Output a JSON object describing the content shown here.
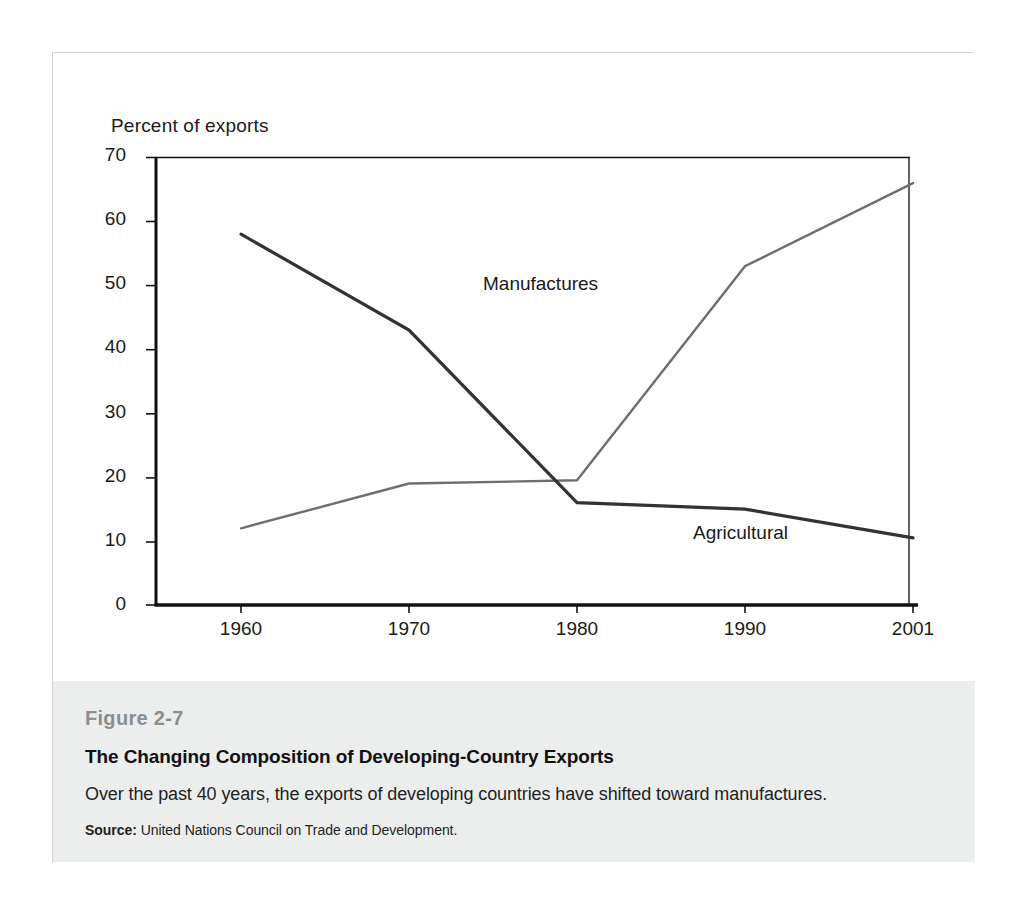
{
  "figure": {
    "number": "Figure 2-7",
    "title": "The Changing Composition of Developing-Country Exports",
    "description": "Over the past 40 years, the exports of developing countries have shifted toward manufactures.",
    "source_label": "Source:",
    "source_text": "United Nations Council on Trade and Development."
  },
  "chart_data": {
    "type": "line",
    "title": "",
    "subtitle": "",
    "xlabel": "",
    "ylabel": "Percent of exports",
    "x": [
      1960,
      1970,
      1980,
      1990,
      2001
    ],
    "categories": [
      "1960",
      "1970",
      "1980",
      "1990",
      "2001"
    ],
    "xtick_labels": [
      "1960",
      "1970",
      "1980",
      "1990",
      "2001"
    ],
    "ytick_labels": [
      "0",
      "10",
      "20",
      "30",
      "40",
      "50",
      "60",
      "70"
    ],
    "yticks": [
      0,
      10,
      20,
      30,
      40,
      50,
      60,
      70
    ],
    "ylim": [
      0,
      70
    ],
    "xlim": [
      1960,
      2001
    ],
    "grid": false,
    "legend_position": "inline-annotation",
    "series": [
      {
        "name": "Agricultural",
        "values": [
          58,
          43,
          16,
          15,
          10.5
        ],
        "color": "#333333",
        "width": 3.2,
        "label": "Agricultural",
        "label_value": "Agricultural"
      },
      {
        "name": "Manufactures",
        "values": [
          12,
          19,
          19.5,
          53,
          66
        ],
        "color": "#6e6e6e",
        "width": 2.4,
        "label": "Manufactures",
        "label_value": "Manufactures"
      }
    ],
    "annotations": [
      {
        "text": "Manufactures",
        "x": 1980,
        "y": 56
      },
      {
        "text": "Agricultural",
        "x": 1992,
        "y": 21
      }
    ]
  },
  "colors": {
    "axis": "#111111",
    "agricultural": "#333333",
    "manufactures": "#6e6e6e",
    "caption_band": "#eceded",
    "figure_number": "#8a8e91",
    "card_border": "#d2d2d2"
  }
}
